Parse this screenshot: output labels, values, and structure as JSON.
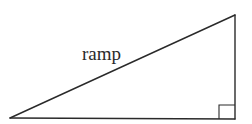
{
  "diagram": {
    "type": "right-triangle",
    "hypotenuse_label": "ramp",
    "stroke_color": "#2a2a2a",
    "background_color": "#ffffff",
    "vertices": {
      "bottom_left": [
        10,
        118
      ],
      "bottom_right": [
        235,
        119
      ],
      "top_right": [
        235,
        15
      ]
    },
    "right_angle_marker": {
      "corner": "bottom_right",
      "size": 16
    }
  }
}
